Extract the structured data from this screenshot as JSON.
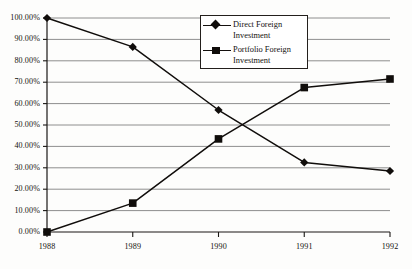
{
  "chart_data": {
    "type": "line",
    "title": "",
    "subtitle": "",
    "xlabel": "",
    "ylabel": "",
    "x": [
      "1988",
      "1989",
      "1990",
      "1991",
      "1992"
    ],
    "categories": [
      "1988",
      "1989",
      "1990",
      "1991",
      "1992"
    ],
    "series": [
      {
        "name": "Direct Foreign Investment",
        "marker": "diamond",
        "color": "#100d0b",
        "values": [
          100.0,
          86.5,
          57.0,
          32.5,
          28.5
        ]
      },
      {
        "name": "Portfolio Foreign Investment",
        "marker": "square",
        "color": "#100d0b",
        "values": [
          0.0,
          13.5,
          43.5,
          67.5,
          71.5
        ]
      }
    ],
    "ylim": [
      0,
      100
    ],
    "y_ticks": [
      0,
      10,
      20,
      30,
      40,
      50,
      60,
      70,
      80,
      90,
      100
    ],
    "y_tick_labels": [
      "0.00%",
      "10.00%",
      "20.00%",
      "30.00%",
      "40.00%",
      "50.00%",
      "60.00%",
      "70.00%",
      "80.00%",
      "90.00%",
      "100.00%"
    ],
    "x_tick_labels": [
      "1988",
      "1989",
      "1990",
      "1991",
      "1992"
    ],
    "grid": {
      "horizontal": true,
      "vertical": false,
      "color": "#8e8e8e"
    },
    "legend": {
      "position": "top-center",
      "bordered": true,
      "entries": [
        {
          "label_line1": "Direct Foreign",
          "label_line2": "Investment",
          "marker": "diamond"
        },
        {
          "label_line1": "Portfolio Foreign",
          "label_line2": "Investment",
          "marker": "square"
        }
      ]
    },
    "axis_color": "#1a1714",
    "plot_background": "#fdfdfc"
  }
}
